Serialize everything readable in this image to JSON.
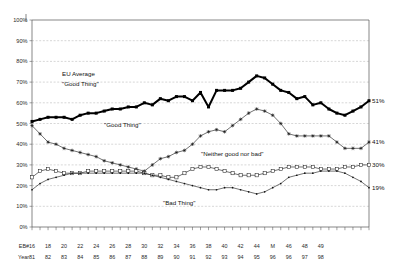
{
  "chart_data": {
    "type": "line",
    "title": "",
    "xlabel": "",
    "ylabel": "",
    "ylim": [
      0,
      100
    ],
    "ytick_labels": [
      "0%",
      "10%",
      "20%",
      "30%",
      "40%",
      "50%",
      "60%",
      "70%",
      "80%",
      "90%",
      "100%"
    ],
    "ytick_values": [
      0,
      10,
      20,
      30,
      40,
      50,
      60,
      70,
      80,
      90,
      100
    ],
    "grid": true,
    "legend": "inline-annotations",
    "x_row_labels": [
      "EB#",
      "Year"
    ],
    "eb_numbers": [
      "16",
      "17",
      "18",
      "19",
      "20",
      "21",
      "22",
      "23",
      "24",
      "25",
      "26",
      "27",
      "28",
      "29",
      "30",
      "31",
      "32",
      "33",
      "34",
      "35",
      "36",
      "37",
      "38",
      "39",
      "40",
      "41",
      "42",
      "43",
      "44",
      "M",
      "46",
      "47",
      "48",
      "49"
    ],
    "eb_labels_shown": [
      "16",
      "18",
      "20",
      "22",
      "24",
      "26",
      "28",
      "30",
      "32",
      "34",
      "36",
      "38",
      "40",
      "42",
      "44",
      "M",
      "46",
      "48",
      "49"
    ],
    "year_labels": [
      "81",
      "",
      "82",
      "",
      "83",
      "",
      "84",
      "",
      "85",
      "",
      "86",
      "",
      "87",
      "",
      "88",
      "",
      "89",
      "",
      "90",
      "",
      "91",
      "",
      "92",
      "",
      "93",
      "",
      "94",
      "",
      "95",
      "96",
      "96",
      "",
      "97",
      "98"
    ],
    "year_labels_shown": [
      "81",
      "82",
      "83",
      "84",
      "85",
      "86",
      "87",
      "88",
      "89",
      "90",
      "91",
      "92",
      "93",
      "94",
      "95",
      "96",
      "96",
      "97",
      "98"
    ],
    "series": [
      {
        "name": "EU Average \"Good Thing\"",
        "marker": "filled-square",
        "line": "thick",
        "end_label": "51%",
        "values": [
          51,
          52,
          53,
          53,
          53,
          52,
          54,
          55,
          55,
          56,
          57,
          57,
          58,
          58,
          60,
          59,
          62,
          61,
          63,
          63,
          61,
          65,
          58,
          66,
          66,
          66,
          67,
          70,
          73,
          72,
          69,
          66,
          65,
          62,
          63,
          59,
          60,
          57,
          55,
          54,
          56,
          58,
          61
        ]
      },
      {
        "name": "\"Good Thing\"",
        "marker": "star",
        "line": "thin",
        "end_label": "41%",
        "values": [
          49,
          45,
          41,
          40,
          38,
          37,
          36,
          35,
          34,
          32,
          31,
          30,
          29,
          28,
          27,
          30,
          33,
          34,
          36,
          37,
          40,
          44,
          46,
          47,
          46,
          49,
          52,
          55,
          57,
          56,
          54,
          50,
          45,
          44,
          44,
          44,
          44,
          44,
          41,
          38,
          38,
          38,
          41
        ]
      },
      {
        "name": "\"Neither good nor bad\"",
        "marker": "open-square",
        "line": "thin",
        "end_label": "30%",
        "values": [
          24,
          27,
          28,
          27,
          26,
          26,
          26,
          27,
          27,
          27,
          27,
          27,
          27,
          27,
          26,
          25,
          25,
          24,
          24,
          26,
          28,
          29,
          29,
          28,
          27,
          26,
          25,
          25,
          25,
          26,
          27,
          28,
          29,
          29,
          29,
          29,
          28,
          28,
          28,
          29,
          29,
          30,
          30
        ]
      },
      {
        "name": "\"Bad Thing\"",
        "marker": "dot",
        "line": "thin",
        "end_label": "19%",
        "values": [
          18,
          21,
          23,
          24,
          25,
          26,
          26,
          26,
          26,
          26,
          26,
          26,
          26,
          26,
          26,
          25,
          24,
          23,
          22,
          21,
          20,
          19,
          18,
          18,
          19,
          19,
          18,
          17,
          16,
          17,
          19,
          21,
          24,
          25,
          26,
          26,
          27,
          27,
          27,
          26,
          24,
          22,
          19
        ]
      }
    ],
    "annotations": [
      {
        "text": "EU Average",
        "x": 62,
        "y": 76
      },
      {
        "text": "\"Good Thing\"",
        "x": 62,
        "y": 86
      },
      {
        "text": "\"Good Thing\"",
        "x": 104,
        "y": 127
      },
      {
        "text": "\"Neither good nor bad\"",
        "x": 201,
        "y": 156
      },
      {
        "text": "\"Bad Thing\"",
        "x": 163,
        "y": 205
      }
    ]
  },
  "colors": {
    "series_line": "#111111",
    "grid": "#9a9a9a",
    "axis": "#555555",
    "background": "#ffffff"
  }
}
